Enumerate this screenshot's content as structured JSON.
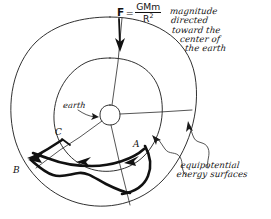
{
  "figure": {
    "background_color": "#ffffff",
    "ink_color": "#111111"
  },
  "formula": {
    "symbol": "F",
    "equals": "=",
    "numerator": "GMm",
    "denominator": "R",
    "denominator_exponent": "2",
    "plain": "F = GMm/R^2"
  },
  "annotations": {
    "magnitude": {
      "lines": [
        "magnitude",
        "directed",
        "toward the",
        "center of",
        "the earth"
      ]
    },
    "equipotential": {
      "lines": [
        "equipotential",
        "energy surfaces"
      ]
    }
  },
  "labels": {
    "earth": "earth",
    "point_a": "A",
    "point_b": "B",
    "point_c": "C"
  },
  "geometry": {
    "center": {
      "x": 110,
      "y": 115
    },
    "earth_radius": 10,
    "inner_circle_radius": 57,
    "outer_circle_radius": 98,
    "radial_lines": 4
  },
  "icons": {
    "force_arrow": "down-arrow-icon",
    "earth_pointer": "pointer-arrow-icon",
    "surface_pointer_inner": "squiggle-pointer-icon",
    "surface_pointer_outer": "squiggle-pointer-icon",
    "path_arrow_a": "path-arrow-icon",
    "path_arrow_mid": "path-arrow-icon",
    "path_arrow_b": "path-arrow-icon",
    "path_arrow_c": "path-arrow-icon"
  }
}
